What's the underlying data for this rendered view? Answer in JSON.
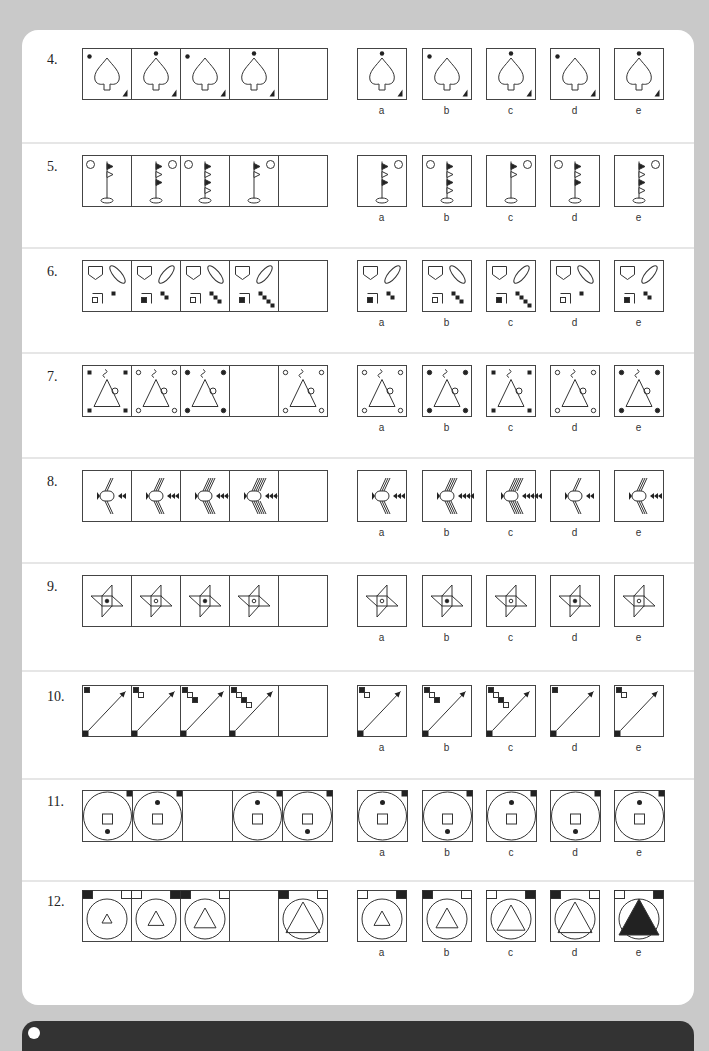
{
  "questions": [
    {
      "number": "4.",
      "sequence_frames": 5,
      "empty_frame": 5,
      "options": [
        "a",
        "b",
        "c",
        "d",
        "e"
      ]
    },
    {
      "number": "5.",
      "sequence_frames": 5,
      "empty_frame": 5,
      "options": [
        "a",
        "b",
        "c",
        "d",
        "e"
      ]
    },
    {
      "number": "6.",
      "sequence_frames": 5,
      "empty_frame": 5,
      "options": [
        "a",
        "b",
        "c",
        "d",
        "e"
      ]
    },
    {
      "number": "7.",
      "sequence_frames": 5,
      "empty_frame": 4,
      "options": [
        "a",
        "b",
        "c",
        "d",
        "e"
      ]
    },
    {
      "number": "8.",
      "sequence_frames": 5,
      "empty_frame": 5,
      "options": [
        "a",
        "b",
        "c",
        "d",
        "e"
      ]
    },
    {
      "number": "9.",
      "sequence_frames": 5,
      "empty_frame": 5,
      "options": [
        "a",
        "b",
        "c",
        "d",
        "e"
      ]
    },
    {
      "number": "10.",
      "sequence_frames": 5,
      "empty_frame": 5,
      "options": [
        "a",
        "b",
        "c",
        "d",
        "e"
      ]
    },
    {
      "number": "11.",
      "sequence_frames": 5,
      "empty_frame": 3,
      "options": [
        "a",
        "b",
        "c",
        "d",
        "e"
      ]
    },
    {
      "number": "12.",
      "sequence_frames": 5,
      "empty_frame": 4,
      "options": [
        "a",
        "b",
        "c",
        "d",
        "e"
      ]
    }
  ]
}
